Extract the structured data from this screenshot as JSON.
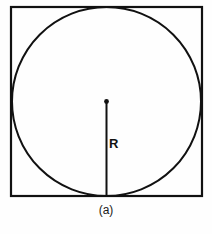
{
  "figure": {
    "caption": "(a)",
    "radius_label": "R",
    "colors": {
      "stroke": "#111111",
      "background": "#fefefe",
      "text": "#1a1a1a"
    },
    "geometry": {
      "square": {
        "x": 11,
        "y": 7,
        "width": 191,
        "height": 189
      },
      "circle": {
        "cx": 106.5,
        "cy": 101.5,
        "r": 94.5
      },
      "radius_line": {
        "x": 106.5,
        "y_start": 101.5,
        "y_end": 196
      },
      "center_dot": {
        "cx": 106.5,
        "cy": 101.5,
        "r": 2.2
      }
    }
  }
}
